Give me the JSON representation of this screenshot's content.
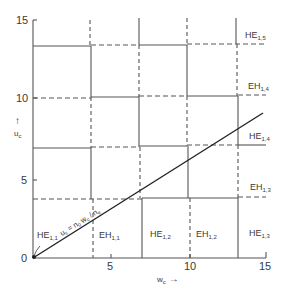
{
  "diagram": {
    "type": "mode chart",
    "x_axis": {
      "label": "w",
      "label_sub": "c",
      "arrow": "→",
      "ticks": [
        "0",
        "5",
        "10",
        "15"
      ],
      "range": [
        0,
        15
      ]
    },
    "y_axis": {
      "label": "u",
      "label_sub": "c",
      "arrow": "↑",
      "ticks": [
        "0",
        "5",
        "10",
        "15"
      ],
      "range": [
        0,
        15
      ]
    },
    "line": {
      "label_mode": "HE",
      "label_mode_sub": "1,1",
      "equation": "u",
      "equation_sub": "c",
      "equation_rest": " = n",
      "equation_sub2": "0",
      "equation_rest2": " w",
      "equation_sub3": "c",
      "equation_rest3": " / n",
      "equation_sub4": "e",
      "from": [
        0,
        0
      ],
      "to": [
        15,
        9.3
      ]
    },
    "region_labels": [
      {
        "id": "eh-1-1-bottom",
        "base": "EH",
        "sub": "1,1"
      },
      {
        "id": "he-1-2-bottom",
        "base": "HE",
        "sub": "1,2"
      },
      {
        "id": "eh-1-2-bottom",
        "base": "EH",
        "sub": "1,2"
      },
      {
        "id": "he-1-3-bottom",
        "base": "HE",
        "sub": "1,3"
      },
      {
        "id": "eh-1-3-right",
        "base": "EH",
        "sub": "1,3"
      },
      {
        "id": "he-1-4-right",
        "base": "HE",
        "sub": "1,4"
      },
      {
        "id": "eh-1-4-right",
        "base": "EH",
        "sub": "1,4"
      },
      {
        "id": "he-1-5-right",
        "base": "HE",
        "sub": "1,5"
      }
    ]
  }
}
